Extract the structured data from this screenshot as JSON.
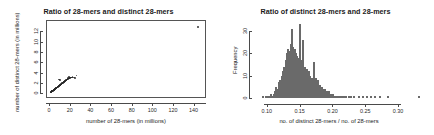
{
  "figure": {
    "background": "#ffffff",
    "point_color": "#282828",
    "bar_fill": "#b9b9b9",
    "bar_edge": "#6a6a6a",
    "axis_color": "#4a4a4a"
  },
  "panels": [
    {
      "id": "scatter-panel",
      "title": "Ratio of 28-mers and distinct 28-mers",
      "xlabel": "number of 28-mers (in millions)",
      "ylabel": "number of distinct 28-mers (in millions)"
    },
    {
      "id": "histogram-panel",
      "title": "Ratio of distinct 28-mers and 28-mers",
      "xlabel": "no. of distinct 28-mers / no. of 28-mers",
      "ylabel": "Frequency"
    }
  ],
  "chart_data": [
    {
      "type": "scatter",
      "title": "Ratio of 28-mers and distinct 28-mers",
      "xlabel": "number of 28-mers (in millions)",
      "ylabel": "number of distinct 28-mers (in millions)",
      "xlim": [
        -3,
        152
      ],
      "ylim": [
        -0.9,
        14.2
      ],
      "xticks": [
        0,
        20,
        40,
        60,
        80,
        100,
        120,
        140
      ],
      "yticks": [
        0,
        2,
        4,
        6,
        8,
        10,
        12
      ],
      "grid": false,
      "legend": null,
      "points": [
        [
          1.2,
          0.15
        ],
        [
          1.5,
          0.2
        ],
        [
          1.8,
          0.22
        ],
        [
          2.0,
          0.25
        ],
        [
          2.2,
          0.3
        ],
        [
          2.4,
          0.3
        ],
        [
          2.6,
          0.35
        ],
        [
          2.8,
          0.4
        ],
        [
          3.0,
          0.4
        ],
        [
          3.1,
          0.45
        ],
        [
          3.3,
          0.48
        ],
        [
          3.5,
          0.5
        ],
        [
          3.6,
          0.52
        ],
        [
          3.8,
          0.55
        ],
        [
          4.0,
          0.58
        ],
        [
          4.1,
          0.6
        ],
        [
          4.3,
          0.62
        ],
        [
          4.5,
          0.65
        ],
        [
          4.6,
          0.68
        ],
        [
          4.8,
          0.7
        ],
        [
          5.0,
          0.72
        ],
        [
          5.2,
          0.75
        ],
        [
          5.4,
          0.78
        ],
        [
          5.5,
          0.8
        ],
        [
          5.7,
          0.85
        ],
        [
          5.9,
          0.88
        ],
        [
          6.1,
          0.9
        ],
        [
          6.3,
          0.92
        ],
        [
          6.5,
          0.95
        ],
        [
          6.7,
          0.98
        ],
        [
          6.9,
          1.0
        ],
        [
          7.1,
          1.05
        ],
        [
          7.3,
          1.08
        ],
        [
          7.5,
          1.1
        ],
        [
          7.7,
          1.12
        ],
        [
          7.9,
          1.15
        ],
        [
          8.1,
          1.2
        ],
        [
          8.3,
          1.22
        ],
        [
          8.5,
          1.25
        ],
        [
          8.7,
          1.3
        ],
        [
          8.9,
          1.32
        ],
        [
          9.1,
          1.35
        ],
        [
          9.3,
          1.38
        ],
        [
          9.5,
          1.4
        ],
        [
          9.7,
          1.45
        ],
        [
          9.9,
          1.48
        ],
        [
          10.1,
          1.5
        ],
        [
          10.3,
          1.55
        ],
        [
          10.5,
          1.58
        ],
        [
          10.7,
          1.6
        ],
        [
          10.9,
          1.65
        ],
        [
          11.1,
          1.68
        ],
        [
          11.3,
          1.7
        ],
        [
          11.5,
          1.75
        ],
        [
          11.7,
          1.78
        ],
        [
          11.9,
          1.8
        ],
        [
          12.1,
          1.85
        ],
        [
          12.3,
          1.88
        ],
        [
          12.5,
          1.9
        ],
        [
          12.7,
          1.95
        ],
        [
          12.9,
          1.98
        ],
        [
          13.1,
          2.0
        ],
        [
          13.3,
          2.05
        ],
        [
          13.5,
          2.08
        ],
        [
          13.7,
          2.1
        ],
        [
          13.9,
          2.15
        ],
        [
          14.1,
          2.18
        ],
        [
          14.3,
          2.2
        ],
        [
          14.5,
          2.25
        ],
        [
          14.8,
          2.28
        ],
        [
          15.0,
          2.3
        ],
        [
          15.2,
          2.35
        ],
        [
          15.5,
          2.4
        ],
        [
          15.8,
          2.45
        ],
        [
          16.0,
          2.48
        ],
        [
          16.3,
          2.5
        ],
        [
          16.6,
          2.55
        ],
        [
          16.9,
          2.6
        ],
        [
          17.2,
          2.65
        ],
        [
          17.5,
          2.7
        ],
        [
          17.8,
          2.72
        ],
        [
          18.0,
          2.78
        ],
        [
          18.3,
          2.8
        ],
        [
          18.6,
          2.85
        ],
        [
          19.0,
          2.9
        ],
        [
          19.4,
          2.95
        ],
        [
          19.8,
          3.0
        ],
        [
          20.2,
          3.0
        ],
        [
          20.6,
          3.05
        ],
        [
          21.0,
          3.1
        ],
        [
          21.5,
          3.05
        ],
        [
          22.0,
          3.1
        ],
        [
          22.6,
          3.12
        ],
        [
          9.8,
          2.7
        ],
        [
          10.5,
          2.55
        ],
        [
          26.5,
          3.45
        ],
        [
          24.0,
          3.1
        ],
        [
          25.0,
          3.0
        ],
        [
          19.5,
          3.2
        ],
        [
          18.0,
          3.1
        ],
        [
          144.5,
          12.9
        ]
      ],
      "outlier_note": "single far-right point near (145, 13)"
    },
    {
      "type": "bar",
      "subtype": "histogram",
      "title": "Ratio of distinct 28-mers and 28-mers",
      "xlabel": "no. of distinct 28-mers / no. of 28-mers",
      "ylabel": "Frequency",
      "xlim": [
        0.082,
        0.338
      ],
      "ylim": [
        0,
        34
      ],
      "xticks": [
        0.1,
        0.15,
        0.2,
        0.25,
        0.3
      ],
      "yticks": [
        0,
        10,
        20,
        30
      ],
      "grid": false,
      "legend": null,
      "bin_width": 0.002,
      "categories": [
        0.094,
        0.096,
        0.098,
        0.1,
        0.102,
        0.104,
        0.106,
        0.108,
        0.11,
        0.112,
        0.114,
        0.116,
        0.118,
        0.12,
        0.122,
        0.124,
        0.126,
        0.128,
        0.13,
        0.132,
        0.134,
        0.136,
        0.138,
        0.14,
        0.142,
        0.144,
        0.146,
        0.148,
        0.15,
        0.152,
        0.154,
        0.156,
        0.158,
        0.16,
        0.162,
        0.164,
        0.166,
        0.168,
        0.17,
        0.172,
        0.174,
        0.176,
        0.178,
        0.18,
        0.182,
        0.184,
        0.186,
        0.188,
        0.19,
        0.192,
        0.194,
        0.196,
        0.198,
        0.2,
        0.202,
        0.204,
        0.206,
        0.208,
        0.21,
        0.212,
        0.214,
        0.216,
        0.218,
        0.22,
        0.224,
        0.228,
        0.232,
        0.24,
        0.246,
        0.252,
        0.258,
        0.264,
        0.272,
        0.284,
        0.332
      ],
      "values": [
        1,
        0,
        1,
        0,
        1,
        1,
        2,
        1,
        2,
        3,
        5,
        4,
        7,
        8,
        10,
        12,
        14,
        17,
        20,
        22,
        21,
        24,
        31,
        23,
        22,
        20,
        19,
        18,
        33,
        17,
        26,
        12,
        14,
        13,
        11,
        12,
        10,
        9,
        8,
        16,
        9,
        7,
        8,
        6,
        5,
        5,
        4,
        4,
        3,
        3,
        3,
        2,
        2,
        2,
        1,
        1,
        1,
        1,
        1,
        1,
        1,
        1,
        1,
        1,
        1,
        1,
        1,
        1,
        1,
        1,
        1,
        1,
        1,
        1,
        1
      ]
    }
  ]
}
